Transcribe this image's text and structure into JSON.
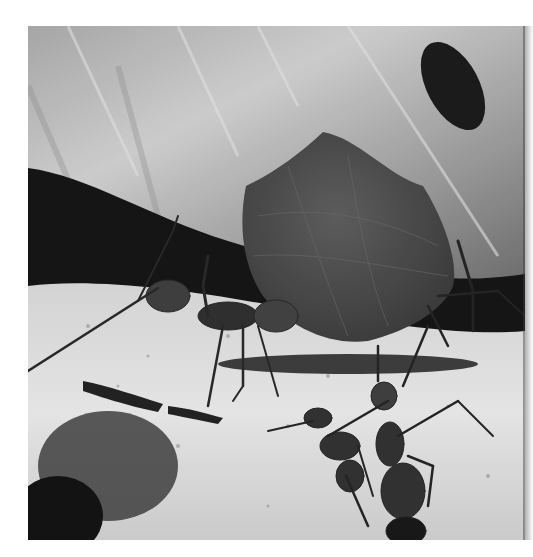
{
  "image": {
    "subject": "Leaf-cutter ants carrying a leaf fragment over sandy ground",
    "style": "grayscale photograph",
    "frame": {
      "x": 28,
      "y": 26,
      "width": 497,
      "height": 514
    },
    "colors": {
      "background": "#ffffff",
      "upper_leaf_light": "#c8c8c8",
      "upper_leaf_mid": "#9a9a9a",
      "dark_band": "#0e0e0e",
      "carried_leaf": "#4a4a4a",
      "ground_light": "#e6e6e6",
      "ground_speckle": "#7a7a7a",
      "ant_body": "#2a2a2a"
    },
    "elements": [
      "upper-backdrop-leaf",
      "dark-shadow-band",
      "carried-leaf-fragment",
      "ant-carrying-leaf",
      "ant-right-background",
      "ant-pair-foreground",
      "sandy-ground",
      "debris-bottom-left"
    ]
  }
}
